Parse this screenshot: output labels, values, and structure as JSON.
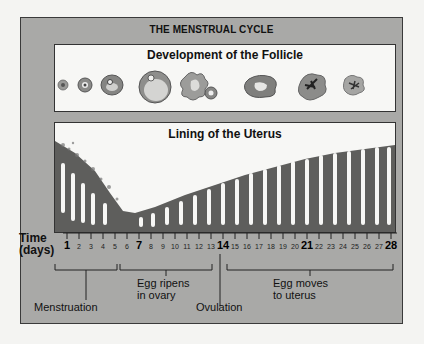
{
  "diagram": {
    "title": "THE MENSTRUAL CYCLE",
    "follicle_panel": {
      "title": "Development of the Follicle",
      "stages": [
        "primordial follicle",
        "primary follicle",
        "secondary follicle",
        "mature follicle",
        "ovulating follicle",
        "corpus luteum",
        "corpus luteum (degenerating)",
        "corpus albicans"
      ]
    },
    "uterus_panel": {
      "title": "Lining of the Uterus"
    },
    "time_axis": {
      "label_line1": "Time",
      "label_line2": "(days)",
      "days": [
        "1",
        "2",
        "3",
        "4",
        "5",
        "6",
        "7",
        "8",
        "9",
        "10",
        "11",
        "12",
        "13",
        "14",
        "15",
        "16",
        "17",
        "18",
        "19",
        "20",
        "21",
        "22",
        "23",
        "24",
        "25",
        "26",
        "27",
        "28"
      ],
      "major_days": [
        "1",
        "7",
        "14",
        "21",
        "28"
      ]
    },
    "phases": [
      {
        "label": "Menstruation",
        "range": "1-5"
      },
      {
        "label_line1": "Egg ripens",
        "label_line2": "in ovary",
        "range": "5-13"
      },
      {
        "label": "Ovulation",
        "day": "14"
      },
      {
        "label_line1": "Egg moves",
        "label_line2": "to uterus",
        "range": "15-28"
      }
    ],
    "colors": {
      "frame": "#a9a9a7",
      "panel": "#f7f7f5",
      "tissue": "#5a5a58",
      "follicle": "#8a8a88"
    }
  }
}
